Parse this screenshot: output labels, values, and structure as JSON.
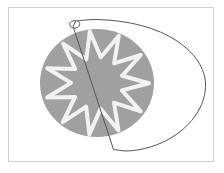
{
  "canvas": {
    "title": "Drawing Canvas",
    "width": 224,
    "height": 173,
    "background_color": "#ffffff",
    "frame": {
      "label": "canvas-frame",
      "border_color": "#cfcfcf",
      "border_width": 1,
      "left": 8,
      "top": 7,
      "width": 206,
      "height": 155,
      "fill_color": "#ffffff"
    }
  },
  "shapes": {
    "circle": {
      "label": "gray-circle",
      "fill_color": "#a0a0a0",
      "center_x": 92,
      "center_y": 80,
      "radius_x": 58,
      "radius_y": 55
    },
    "star": {
      "label": "starburst",
      "points": 11,
      "stroke_color": "#f2f2f2",
      "stroke_width": 4,
      "fill_color": "#a0a0a0",
      "center_x": 92,
      "center_y": 80,
      "outer_radius": 52,
      "inner_radius": 26,
      "rotation_deg": -8
    },
    "curve": {
      "label": "teardrop-outline",
      "stroke_color": "#555555",
      "stroke_width": 1,
      "fill": "none",
      "loop": {
        "label": "loop-knot",
        "center_x": 72,
        "center_y": 21,
        "radius": 5
      },
      "corner_vertex_x": 112,
      "corner_vertex_y": 148,
      "rightmost_x": 203
    }
  },
  "colors": {
    "gray_fill": "#a0a0a0",
    "star_stroke": "#f2f2f2",
    "line_stroke": "#555555",
    "frame_border": "#cfcfcf",
    "page_background": "#ffffff"
  }
}
